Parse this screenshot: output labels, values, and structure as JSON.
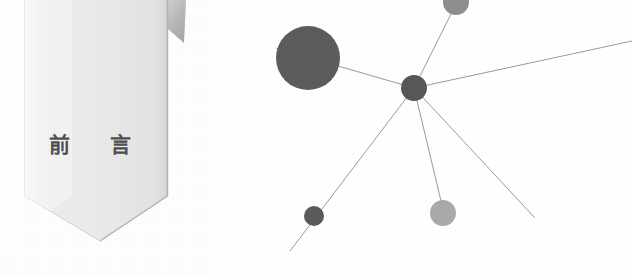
{
  "page": {
    "width": 632,
    "height": 275,
    "background_color": "#fefefe"
  },
  "banner": {
    "title_text": "前 言",
    "title_meaning": "Preface",
    "fill_color": "#ededed",
    "fill_color_dark": "#dcdcdc",
    "fold_color": "#b9b9b9",
    "edge_color": "#b2b2b2",
    "text_color": "#4e4e4e",
    "shape": "pennant",
    "geometry": {
      "left": 24,
      "right": 168,
      "top": 0,
      "notch_y": 196,
      "point_x": 100,
      "point_y": 241,
      "fold_tip_x": 184,
      "fold_tip_y": 43
    }
  },
  "network": {
    "accent_color": "#5c5c5c",
    "accent_color_light": "#a9a9a9",
    "edge_color": "#9a9a9a",
    "edge_width": 1,
    "nodes": [
      {
        "id": "hub",
        "label": "central-hub-node",
        "cx": 414,
        "cy": 88,
        "r": 13,
        "color": "#575757"
      },
      {
        "id": "big-left",
        "label": "large-left-node",
        "cx": 308,
        "cy": 58,
        "r": 32,
        "color": "#5c5c5c"
      },
      {
        "id": "top",
        "label": "top-clipped-node",
        "cx": 456,
        "cy": 2,
        "r": 13,
        "color": "#8e8e8e"
      },
      {
        "id": "lower-left",
        "label": "lower-left-node",
        "cx": 314,
        "cy": 216,
        "r": 10,
        "color": "#5a5a5a"
      },
      {
        "id": "lower-mid",
        "label": "lower-middle-node",
        "cx": 443,
        "cy": 213,
        "r": 13,
        "color": "#a9a9a9"
      }
    ],
    "edges": [
      {
        "id": "e-hub-bigleft",
        "label": "edge-hub-to-large-left-node",
        "x1": 414,
        "y1": 88,
        "x2": 276,
        "y2": 48
      },
      {
        "id": "e-hub-top",
        "label": "edge-hub-to-top-node",
        "x1": 414,
        "y1": 88,
        "x2": 453,
        "y2": 10
      },
      {
        "id": "e-hub-right",
        "label": "edge-hub-to-right-edge",
        "x1": 414,
        "y1": 88,
        "x2": 632,
        "y2": 41
      },
      {
        "id": "e-hub-lowerleft",
        "label": "edge-hub-to-lower-left",
        "x1": 414,
        "y1": 88,
        "x2": 290,
        "y2": 251
      },
      {
        "id": "e-hub-lowermid",
        "label": "edge-hub-to-lower-middle",
        "x1": 414,
        "y1": 88,
        "x2": 441,
        "y2": 201
      },
      {
        "id": "e-hub-lowerright",
        "label": "edge-hub-to-lower-right",
        "x1": 414,
        "y1": 88,
        "x2": 535,
        "y2": 218
      }
    ]
  }
}
